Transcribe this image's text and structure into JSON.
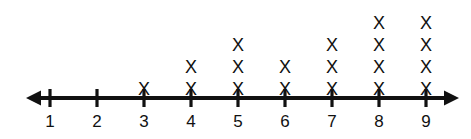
{
  "chart_data": {
    "type": "dot-plot",
    "title": "",
    "subtitle": "",
    "xlabel": "",
    "ylabel": "",
    "mark_glyph": "X",
    "axis_style": "number-line-double-arrow",
    "grid": false,
    "legend": null,
    "xlim": [
      1,
      9
    ],
    "categories": [
      "1",
      "2",
      "3",
      "4",
      "5",
      "6",
      "7",
      "8",
      "9"
    ],
    "values": [
      0,
      0,
      1,
      2,
      3,
      2,
      3,
      4,
      4
    ],
    "points": [
      {
        "label": "1",
        "count": 0
      },
      {
        "label": "2",
        "count": 0
      },
      {
        "label": "3",
        "count": 1
      },
      {
        "label": "4",
        "count": 2
      },
      {
        "label": "5",
        "count": 3
      },
      {
        "label": "6",
        "count": 2
      },
      {
        "label": "7",
        "count": 3
      },
      {
        "label": "8",
        "count": 4
      },
      {
        "label": "9",
        "count": 4
      }
    ],
    "colors": {
      "mark": "#111111",
      "axis": "#111111",
      "background": "#ffffff"
    }
  },
  "geometry": {
    "axis_y": 98,
    "tick_start_x": 50,
    "tick_spacing": 47,
    "tick_half_height": 9,
    "left_arrow_tip_x": 26,
    "right_arrow_tip_x": 459,
    "mark_bottom_y": 80,
    "mark_spacing": 22
  }
}
